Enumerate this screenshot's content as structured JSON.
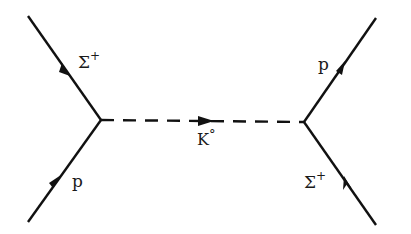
{
  "diagram": {
    "type": "feynman",
    "vertices": [
      {
        "id": "left",
        "x": 101,
        "y": 120
      },
      {
        "id": "right",
        "x": 304,
        "y": 122
      }
    ],
    "particles": [
      {
        "id": "sigma-in-left",
        "label": "Σ",
        "sup": "+",
        "line": "solid"
      },
      {
        "id": "proton-in-left",
        "label": "p",
        "sup": "",
        "line": "solid"
      },
      {
        "id": "kaon",
        "label": "K",
        "sup": "°",
        "line": "dashed"
      },
      {
        "id": "proton-out-right",
        "label": "p",
        "sup": "",
        "line": "solid"
      },
      {
        "id": "sigma-in-right",
        "label": "Σ",
        "sup": "+",
        "line": "solid"
      }
    ],
    "colors": {
      "line": "#111111",
      "background": "#ffffff"
    }
  }
}
